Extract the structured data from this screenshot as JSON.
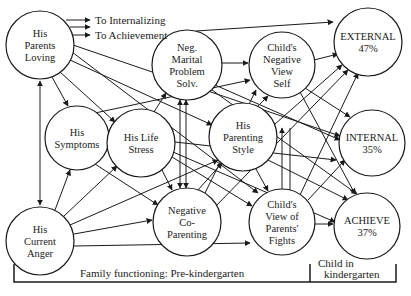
{
  "diagram": {
    "type": "path-model",
    "legend": {
      "to_internalizing": "To Internalizing",
      "to_achievement": "To Achievement"
    },
    "nodes": [
      {
        "id": "parents_loving",
        "lines": [
          "His",
          "Parents",
          "Loving"
        ],
        "x": 40,
        "y": 45,
        "r": 34
      },
      {
        "id": "neg_marital",
        "lines": [
          "Neg.",
          "Marital",
          "Problem",
          "Solv."
        ],
        "x": 187,
        "y": 65,
        "r": 35
      },
      {
        "id": "child_neg_view",
        "lines": [
          "Child's",
          "Negative",
          "View",
          "Self"
        ],
        "x": 282,
        "y": 65,
        "r": 33
      },
      {
        "id": "external",
        "lines": [
          "EXTERNAL",
          "47%"
        ],
        "x": 368,
        "y": 42,
        "r": 34
      },
      {
        "id": "symptoms",
        "lines": [
          "His",
          "Symptoms"
        ],
        "x": 77,
        "y": 138,
        "r": 32
      },
      {
        "id": "life_stress",
        "lines": [
          "His Life",
          "Stress"
        ],
        "x": 141,
        "y": 143,
        "r": 34
      },
      {
        "id": "parenting_style",
        "lines": [
          "His",
          "Parenting",
          "Style"
        ],
        "x": 243,
        "y": 137,
        "r": 34
      },
      {
        "id": "internal",
        "lines": [
          "INTERNAL",
          "35%"
        ],
        "x": 372,
        "y": 143,
        "r": 33
      },
      {
        "id": "current_anger",
        "lines": [
          "His",
          "Current",
          "Anger"
        ],
        "x": 40,
        "y": 241,
        "r": 34
      },
      {
        "id": "neg_coparenting",
        "lines": [
          "Negative",
          "Co-",
          "Parenting"
        ],
        "x": 187,
        "y": 222,
        "r": 34
      },
      {
        "id": "child_view_fights",
        "lines": [
          "Child's",
          "View of",
          "Parents'",
          "Fights"
        ],
        "x": 282,
        "y": 222,
        "r": 33
      },
      {
        "id": "achieve",
        "lines": [
          "ACHIEVE",
          "37%"
        ],
        "x": 367,
        "y": 226,
        "r": 33
      }
    ],
    "sections": {
      "family": "Family functioning: Pre-kindergarten",
      "child_line1": "Child in",
      "child_line2": "kindergarten"
    },
    "outcomes": [
      {
        "name": "EXTERNAL",
        "value": "47%"
      },
      {
        "name": "INTERNAL",
        "value": "35%"
      },
      {
        "name": "ACHIEVE",
        "value": "37%"
      }
    ]
  }
}
